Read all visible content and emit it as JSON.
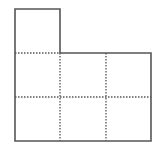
{
  "diagram": {
    "type": "grid-shape",
    "colors": {
      "background": "#ffffff",
      "solid_line": "#555555",
      "dotted_line": "#555555"
    },
    "grid": {
      "columns": 3,
      "rows": 3,
      "x_edges": [
        15,
        60,
        106,
        151
      ],
      "y_edges": [
        9,
        53,
        97,
        141
      ]
    },
    "cells": [
      {
        "row": 0,
        "col": 0,
        "filled": true
      },
      {
        "row": 1,
        "col": 0,
        "filled": true
      },
      {
        "row": 1,
        "col": 1,
        "filled": true
      },
      {
        "row": 1,
        "col": 2,
        "filled": true
      },
      {
        "row": 2,
        "col": 0,
        "filled": true
      },
      {
        "row": 2,
        "col": 1,
        "filled": true
      },
      {
        "row": 2,
        "col": 2,
        "filled": true
      }
    ],
    "outline_points": "15,9 60,9 60,53 151,53 151,141 15,141",
    "dotted_lines": [
      {
        "x1": 15,
        "y1": 53,
        "x2": 60,
        "y2": 53
      },
      {
        "x1": 15,
        "y1": 97,
        "x2": 151,
        "y2": 97
      },
      {
        "x1": 60,
        "y1": 53,
        "x2": 60,
        "y2": 141
      },
      {
        "x1": 106,
        "y1": 53,
        "x2": 106,
        "y2": 141
      }
    ]
  }
}
